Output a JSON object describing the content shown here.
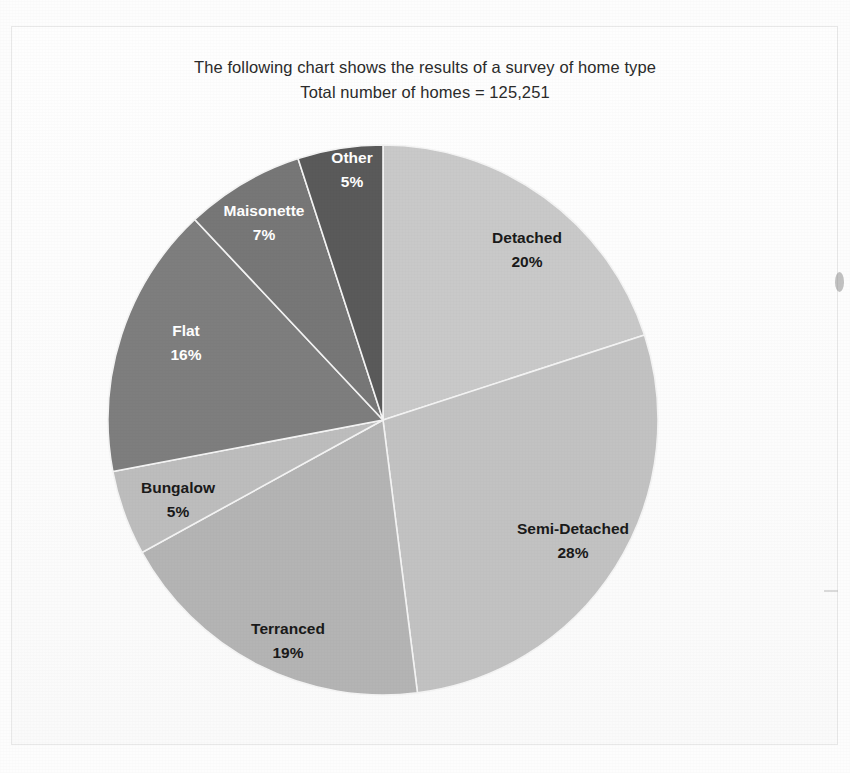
{
  "chart_data": {
    "type": "pie",
    "title": "The following chart shows the results of a survey of home type",
    "subtitle": "Total number of homes = 125,251",
    "total_homes": "125,251",
    "xlabel": "",
    "ylabel": "",
    "legend": "none (labels placed on slices)",
    "grid": false,
    "start_angle_deg": 0,
    "direction": "clockwise",
    "categories": [
      "Detached",
      "Semi-Detached",
      "Terranced",
      "Bungalow",
      "Flat",
      "Maisonette",
      "Other"
    ],
    "values": [
      20,
      28,
      19,
      5,
      16,
      7,
      5
    ],
    "value_unit": "%",
    "slices": [
      {
        "label": "Detached",
        "percent": 20,
        "percent_text": "20%",
        "color": "#c9c9c9",
        "text_color": "#1a1a1a",
        "label_x": 527,
        "label_y": 243
      },
      {
        "label": "Semi-Detached",
        "percent": 28,
        "percent_text": "28%",
        "color": "#c2c2c2",
        "text_color": "#1a1a1a",
        "label_x": 573,
        "label_y": 534
      },
      {
        "label": "Terranced",
        "percent": 19,
        "percent_text": "19%",
        "color": "#b4b4b4",
        "text_color": "#1a1a1a",
        "label_x": 288,
        "label_y": 634
      },
      {
        "label": "Bungalow",
        "percent": 5,
        "percent_text": "5%",
        "color": "#bdbdbd",
        "text_color": "#1a1a1a",
        "label_x": 178,
        "label_y": 493
      },
      {
        "label": "Flat",
        "percent": 16,
        "percent_text": "16%",
        "color": "#7e7e7e",
        "text_color": "#ffffff",
        "label_x": 186,
        "label_y": 336
      },
      {
        "label": "Maisonette",
        "percent": 7,
        "percent_text": "7%",
        "color": "#777777",
        "text_color": "#ffffff",
        "label_x": 264,
        "label_y": 216
      },
      {
        "label": "Other",
        "percent": 5,
        "percent_text": "5%",
        "color": "#5a5a5a",
        "text_color": "#ffffff",
        "label_x": 352,
        "label_y": 163
      }
    ]
  },
  "geometry": {
    "center_x": 383,
    "center_y": 420,
    "radius": 275
  }
}
